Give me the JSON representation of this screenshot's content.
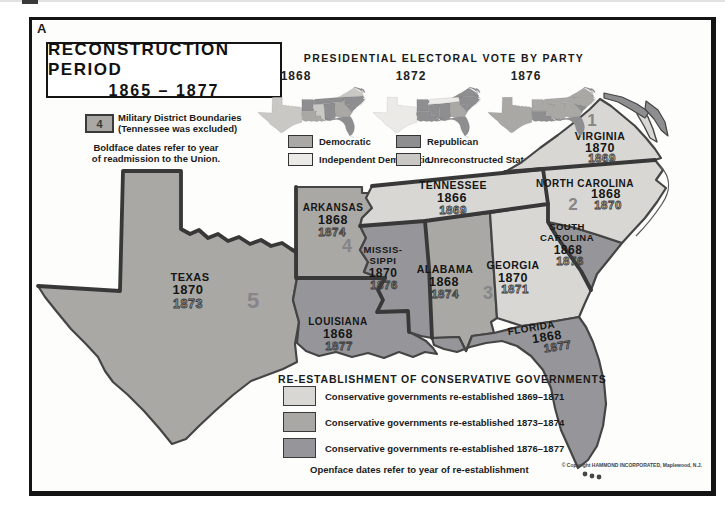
{
  "page": {
    "marker": "A"
  },
  "title_box": {
    "line1": "RECONSTRUCTION PERIOD",
    "line2": "1865 – 1877"
  },
  "electoral": {
    "heading": "PRESIDENTIAL ELECTORAL VOTE BY PARTY",
    "legend": [
      {
        "label": "Democratic",
        "color": "#a9a8a4"
      },
      {
        "label": "Republican",
        "color": "#8e8e91"
      },
      {
        "label": "Independent Democratic",
        "color": "#eceae6"
      },
      {
        "label": "Unreconstructed States",
        "color": "#c9c8c4"
      }
    ],
    "maps": [
      {
        "year": "1868",
        "fills": {
          "texas": "#c9c8c4",
          "arkansas": "#8e8e91",
          "louisiana": "#a9a8a4",
          "mississippi": "#c9c8c4",
          "alabama": "#8e8e91",
          "tennessee": "#8e8e91",
          "georgia": "#a9a8a4",
          "florida": "#8e8e91",
          "south_carolina": "#8e8e91",
          "north_carolina": "#8e8e91",
          "virginia": "#c9c8c4"
        }
      },
      {
        "year": "1872",
        "fills": {
          "texas": "#eceae6",
          "arkansas": "#8e8e91",
          "louisiana": "#8e8e91",
          "mississippi": "#8e8e91",
          "alabama": "#8e8e91",
          "tennessee": "#eceae6",
          "georgia": "#a9a8a4",
          "florida": "#8e8e91",
          "south_carolina": "#8e8e91",
          "north_carolina": "#8e8e91",
          "virginia": "#8e8e91"
        }
      },
      {
        "year": "1876",
        "fills": {
          "texas": "#a9a8a4",
          "arkansas": "#a9a8a4",
          "louisiana": "#8e8e91",
          "mississippi": "#a9a8a4",
          "alabama": "#a9a8a4",
          "tennessee": "#a9a8a4",
          "georgia": "#a9a8a4",
          "florida": "#8e8e91",
          "south_carolina": "#8e8e91",
          "north_carolina": "#a9a8a4",
          "virginia": "#a9a8a4"
        }
      }
    ]
  },
  "district_legend": {
    "symbol": "4",
    "line1": "Military District Boundaries",
    "line2": "(Tennessee was excluded)",
    "note1": "Boldface dates refer to year",
    "note2": "of readmission to the Union."
  },
  "map": {
    "states": [
      {
        "name": "TEXAS",
        "readmitted": "1870",
        "reestablished": "1873",
        "district": "5",
        "color": "#a9a8a4"
      },
      {
        "name": "ARKANSAS",
        "readmitted": "1868",
        "reestablished": "1874",
        "district": "4",
        "color": "#a9a8a4"
      },
      {
        "name": "LOUISIANA",
        "readmitted": "1868",
        "reestablished": "1877",
        "color": "#96969a"
      },
      {
        "name": "MISSIS-",
        "name2": "SIPPI",
        "readmitted": "1870",
        "reestablished": "1876",
        "color": "#96969a"
      },
      {
        "name": "ALABAMA",
        "readmitted": "1868",
        "reestablished": "1874",
        "color": "#a9a8a4"
      },
      {
        "name": "TENNESSEE",
        "readmitted": "1866",
        "reestablished": "1869",
        "color": "#d8d7d3"
      },
      {
        "name": "GEORGIA",
        "readmitted": "1870",
        "reestablished": "1871",
        "district": "3",
        "color": "#d8d7d3"
      },
      {
        "name": "FLORIDA",
        "readmitted": "1868",
        "reestablished": "1877",
        "color": "#96969a"
      },
      {
        "name": "SOUTH",
        "name2": "CAROLINA",
        "readmitted": "1868",
        "reestablished": "1876",
        "color": "#96969a"
      },
      {
        "name": "NORTH CAROLINA",
        "readmitted": "1868",
        "reestablished": "1870",
        "district": "2",
        "color": "#d8d7d3"
      },
      {
        "name": "VIRGINIA",
        "readmitted": "1870",
        "reestablished": "1869",
        "district": "1",
        "color": "#d8d7d3"
      }
    ]
  },
  "conservative_legend": {
    "heading": "RE-ESTABLISHMENT OF CONSERVATIVE GOVERNMENTS",
    "items": [
      {
        "label": "Conservative governments re-established 1869–1871",
        "color": "#d8d7d3"
      },
      {
        "label": "Conservative governments re-established 1873–1874",
        "color": "#a9a8a4"
      },
      {
        "label": "Conservative governments re-established 1876–1877",
        "color": "#96969a"
      }
    ],
    "note": "Openface dates refer to year of re-establishment"
  },
  "copyright": "© Copyright HAMMOND INCORPORATED, Maplewood, N.J."
}
